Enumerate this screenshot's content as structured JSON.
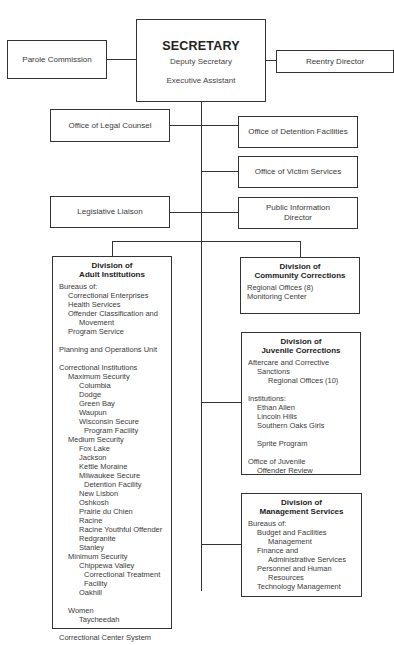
{
  "secretary": {
    "title": "SECRETARY",
    "deputy": "Deputy Secretary",
    "assistant": "Executive Assistant"
  },
  "side_boxes": {
    "parole_commission": "Parole Commission",
    "reentry_director": "Reentry Director"
  },
  "staff_offices": {
    "legal_counsel": "Office of Legal Counsel",
    "detention_facilities": "Office of Detention Facilities",
    "victim_services": "Office of Victim Services",
    "legislative_liaison": "Legislative Liaison",
    "public_information_line1": "Public Information",
    "public_information_line2": "Director"
  },
  "divisions": {
    "adult": {
      "title_line1": "Division of",
      "title_line2": "Adult Institutions",
      "items": [
        {
          "text": "Bureaus of:",
          "indent": 0
        },
        {
          "text": "Correctional Enterprises",
          "indent": 1
        },
        {
          "text": "Health Services",
          "indent": 1
        },
        {
          "text": "Offender Classification and",
          "indent": 1
        },
        {
          "text": "Movement",
          "indent": 2
        },
        {
          "text": "Program Service",
          "indent": 1
        },
        {
          "text": "",
          "indent": -1
        },
        {
          "text": "Planning and Operations Unit",
          "indent": 0
        },
        {
          "text": "",
          "indent": -1
        },
        {
          "text": "Correctional Institutions",
          "indent": 0
        },
        {
          "text": "Maximum Security",
          "indent": 1
        },
        {
          "text": "Columbia",
          "indent": 2
        },
        {
          "text": "Dodge",
          "indent": 2
        },
        {
          "text": "Green Bay",
          "indent": 2
        },
        {
          "text": "Waupun",
          "indent": 2
        },
        {
          "text": "Wisconsin Secure",
          "indent": 2
        },
        {
          "text": "Program Facility",
          "indent": 3
        },
        {
          "text": "Medium Security",
          "indent": 1
        },
        {
          "text": "Fox Lake",
          "indent": 2
        },
        {
          "text": "Jackson",
          "indent": 2
        },
        {
          "text": "Kettle Moraine",
          "indent": 2
        },
        {
          "text": "Milwaukee Secure",
          "indent": 2
        },
        {
          "text": "Detention Facility",
          "indent": 3
        },
        {
          "text": "New Lisbon",
          "indent": 2
        },
        {
          "text": "Oshkosh",
          "indent": 2
        },
        {
          "text": "Prairie du Chien",
          "indent": 2
        },
        {
          "text": "Racine",
          "indent": 2
        },
        {
          "text": "Racine Youthful Offender",
          "indent": 2
        },
        {
          "text": "Redgranite",
          "indent": 2
        },
        {
          "text": "Stanley",
          "indent": 2
        },
        {
          "text": "Minimum Security",
          "indent": 1
        },
        {
          "text": "Chippewa Valley",
          "indent": 2
        },
        {
          "text": "Correctional Treatment",
          "indent": 3
        },
        {
          "text": "Facility",
          "indent": 3
        },
        {
          "text": "Oakhill",
          "indent": 2
        },
        {
          "text": "",
          "indent": -1
        },
        {
          "text": "Women",
          "indent": 1
        },
        {
          "text": "Taycheedah",
          "indent": 2
        },
        {
          "text": "",
          "indent": -1
        },
        {
          "text": "Correctional Center System",
          "indent": 0
        }
      ]
    },
    "community": {
      "title_line1": "Division of",
      "title_line2": "Community Corrections",
      "items": [
        {
          "text": "Regional Offices (8)",
          "indent": 0
        },
        {
          "text": "Monitoring Center",
          "indent": 0
        }
      ]
    },
    "juvenile": {
      "title_line1": "Division of",
      "title_line2": "Juvenile Corrections",
      "items": [
        {
          "text": "Aftercare and Corrective",
          "indent": 0
        },
        {
          "text": "Sanctions",
          "indent": 1
        },
        {
          "text": "Regional Offices (10)",
          "indent": 2
        },
        {
          "text": "",
          "indent": -1
        },
        {
          "text": "Institutions:",
          "indent": 0
        },
        {
          "text": "Ethan Allen",
          "indent": 1
        },
        {
          "text": "Lincoln Hills",
          "indent": 1
        },
        {
          "text": "Southern Oaks Girls",
          "indent": 1
        },
        {
          "text": "",
          "indent": -1
        },
        {
          "text": "Sprite Program",
          "indent": 1
        },
        {
          "text": "",
          "indent": -1
        },
        {
          "text": "Office of Juvenile",
          "indent": 0
        },
        {
          "text": "Offender Review",
          "indent": 1
        }
      ]
    },
    "management": {
      "title_line1": "Division of",
      "title_line2": "Management Services",
      "items": [
        {
          "text": "Bureaus of:",
          "indent": 0
        },
        {
          "text": "Budget and Facilities",
          "indent": 1
        },
        {
          "text": "Management",
          "indent": 2
        },
        {
          "text": "Finance and",
          "indent": 1
        },
        {
          "text": "Administrative Services",
          "indent": 2
        },
        {
          "text": "Personnel and Human",
          "indent": 1
        },
        {
          "text": "Resources",
          "indent": 2
        },
        {
          "text": "Technology Management",
          "indent": 1
        }
      ]
    }
  },
  "colors": {
    "line": "#333333",
    "text": "#3a3a3a",
    "background": "#ffffff"
  }
}
